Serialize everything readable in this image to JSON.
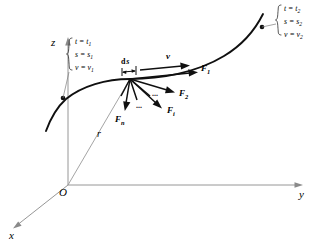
{
  "figure": {
    "background_color": "#ffffff",
    "curve_color": "#101010",
    "axis_color": "#8a8a8a",
    "force_color": "#101010",
    "width": 319,
    "height": 242
  },
  "axes": {
    "x_label": "x",
    "y_label": "y",
    "z_label": "z",
    "origin_label": "O"
  },
  "vectors": {
    "position_label": "r",
    "velocity_label": "v",
    "displacement_label": "ds",
    "displacement_d": "d",
    "displacement_s": "s",
    "force_1": "F",
    "force_1_sub": "1",
    "force_2": "F",
    "force_2_sub": "2",
    "force_i": "F",
    "force_i_sub": "i",
    "force_n": "F",
    "force_n_sub": "n",
    "ellipsis_a": "...",
    "ellipsis_b": "...",
    "ellipsis_c": "..."
  },
  "state_start": {
    "time_var": "t",
    "time_val": "t",
    "time_sub": "1",
    "arc_var": "s",
    "arc_val": "s",
    "arc_sub": "1",
    "speed_var": "v",
    "speed_val": "v",
    "speed_sub": "1",
    "line_1": "t = t",
    "line_2": "s = s",
    "line_3": "v = v",
    "sub": "1"
  },
  "state_end": {
    "time_var": "t",
    "time_val": "t",
    "time_sub": "2",
    "arc_var": "s",
    "arc_val": "s",
    "arc_sub": "2",
    "speed_var": "v",
    "speed_val": "v",
    "speed_sub": "2",
    "line_1": "t = t",
    "line_2": "s = s",
    "line_3": "v = v",
    "sub": "2"
  }
}
